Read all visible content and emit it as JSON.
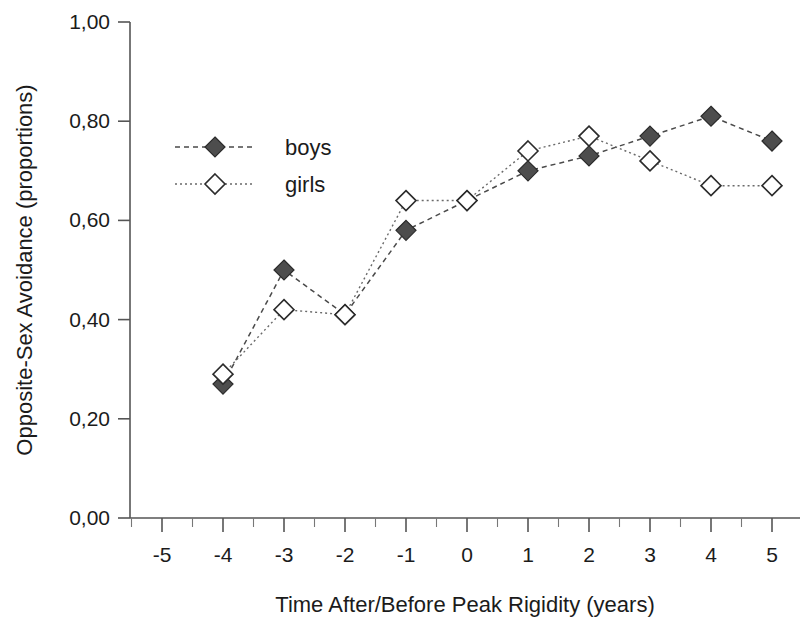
{
  "chart_data": {
    "type": "line",
    "title": "",
    "xlabel": "Time After/Before Peak Rigidity (years)",
    "ylabel": "Opposite-Sex Avoidance (proportions)",
    "xlim": [
      -5.5,
      5.5
    ],
    "ylim": [
      0.0,
      1.0
    ],
    "grid": false,
    "legend_position": "upper-left-inside",
    "x_tick_labels": [
      "-5",
      "-4",
      "-3",
      "-2",
      "-1",
      "0",
      "1",
      "2",
      "3",
      "4",
      "5"
    ],
    "x_tick_values": [
      -5,
      -4,
      -3,
      -2,
      -1,
      0,
      1,
      2,
      3,
      4,
      5
    ],
    "y_tick_labels": [
      "0,00",
      "0,20",
      "0,40",
      "0,60",
      "0,80",
      "1,00"
    ],
    "y_tick_values": [
      0.0,
      0.2,
      0.4,
      0.6,
      0.8,
      1.0
    ],
    "decimal_separator": ",",
    "categories": [
      -4,
      -3,
      -2,
      -1,
      0,
      1,
      2,
      3,
      4,
      5
    ],
    "series": [
      {
        "name": "boys",
        "marker": "filled-diamond",
        "color": "#4d4d4d",
        "line_style": "dashed",
        "x": [
          -4,
          -3,
          -2,
          -1,
          0,
          1,
          2,
          3,
          4,
          5
        ],
        "values": [
          0.27,
          0.5,
          0.41,
          0.58,
          0.64,
          0.7,
          0.73,
          0.77,
          0.81,
          0.76
        ]
      },
      {
        "name": "girls",
        "marker": "open-diamond",
        "color": "#ffffff",
        "line_style": "dotted",
        "x": [
          -4,
          -3,
          -2,
          -1,
          0,
          1,
          2,
          3,
          4,
          5
        ],
        "values": [
          0.29,
          0.42,
          0.41,
          0.64,
          0.64,
          0.74,
          0.77,
          0.72,
          0.67,
          0.67
        ]
      }
    ]
  },
  "legend": {
    "items": [
      {
        "label": "boys",
        "marker": "filled-diamond"
      },
      {
        "label": "girls",
        "marker": "open-diamond"
      }
    ]
  },
  "axes": {
    "x_title": "Time After/Before Peak Rigidity (years)",
    "y_title": "Opposite-Sex Avoidance (proportions)"
  }
}
